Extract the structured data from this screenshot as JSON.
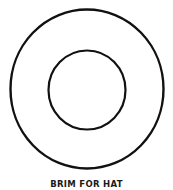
{
  "diagram": {
    "caption": "BRIM FOR HAT",
    "stroke_color": "#111111",
    "outer_circle": {
      "cx": 87,
      "cy": 89,
      "rx": 77,
      "ry": 80
    },
    "inner_circle": {
      "cx": 87,
      "cy": 90,
      "rx": 39,
      "ry": 40
    }
  }
}
